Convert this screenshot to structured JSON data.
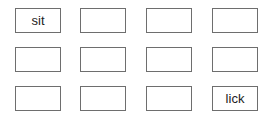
{
  "grid": {
    "rows": 3,
    "cols": 4,
    "cells": [
      {
        "label": "sit",
        "x": 15,
        "y": 8
      },
      {
        "label": "",
        "x": 80,
        "y": 8
      },
      {
        "label": "",
        "x": 146,
        "y": 8
      },
      {
        "label": "",
        "x": 212,
        "y": 8
      },
      {
        "label": "",
        "x": 15,
        "y": 47
      },
      {
        "label": "",
        "x": 80,
        "y": 47
      },
      {
        "label": "",
        "x": 146,
        "y": 47
      },
      {
        "label": "",
        "x": 212,
        "y": 47
      },
      {
        "label": "",
        "x": 15,
        "y": 86
      },
      {
        "label": "",
        "x": 80,
        "y": 86
      },
      {
        "label": "",
        "x": 146,
        "y": 86
      },
      {
        "label": "lick",
        "x": 212,
        "y": 86
      }
    ]
  }
}
